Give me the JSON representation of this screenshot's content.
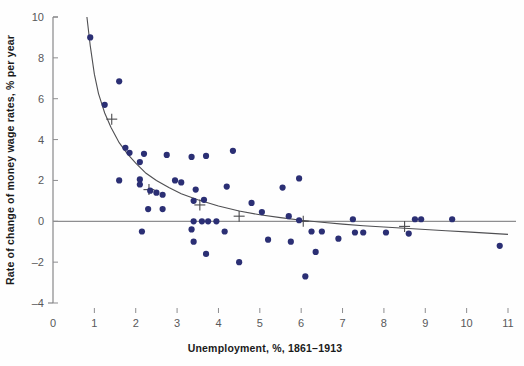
{
  "chart_data": {
    "type": "scatter",
    "title": "",
    "xlabel": "Unemployment, %, 1861–1913",
    "ylabel": "Rate of change of money wage rates, % per year",
    "xlim": [
      0,
      11
    ],
    "ylim": [
      -4,
      10
    ],
    "xticks": [
      0,
      1,
      2,
      3,
      4,
      5,
      6,
      7,
      8,
      9,
      10,
      11
    ],
    "yticks": [
      -4,
      -2,
      0,
      2,
      4,
      6,
      8,
      10
    ],
    "xtick_labels": [
      "0",
      "1",
      "2",
      "3",
      "4",
      "5",
      "6",
      "7",
      "8",
      "9",
      "10",
      "11"
    ],
    "ytick_labels": [
      "-4",
      "-2",
      "0",
      "2",
      "4",
      "6",
      "8",
      "10"
    ],
    "grid": false,
    "legend": false,
    "zero_line": true,
    "series": [
      {
        "name": "Observations",
        "marker": "circle",
        "color": "#2b2f74",
        "points": [
          [
            0.9,
            9.0
          ],
          [
            1.6,
            6.85
          ],
          [
            1.25,
            5.7
          ],
          [
            1.75,
            3.6
          ],
          [
            1.85,
            3.35
          ],
          [
            2.2,
            3.3
          ],
          [
            2.1,
            2.9
          ],
          [
            2.75,
            3.25
          ],
          [
            3.35,
            3.15
          ],
          [
            3.7,
            3.2
          ],
          [
            4.35,
            3.45
          ],
          [
            1.6,
            2.0
          ],
          [
            2.1,
            2.05
          ],
          [
            2.1,
            1.8
          ],
          [
            2.95,
            2.0
          ],
          [
            3.1,
            1.9
          ],
          [
            3.45,
            1.55
          ],
          [
            4.2,
            1.7
          ],
          [
            2.35,
            1.5
          ],
          [
            2.5,
            1.4
          ],
          [
            2.65,
            1.3
          ],
          [
            2.3,
            0.6
          ],
          [
            2.65,
            0.6
          ],
          [
            3.4,
            1.0
          ],
          [
            3.65,
            1.05
          ],
          [
            5.05,
            0.45
          ],
          [
            4.8,
            0.9
          ],
          [
            5.7,
            0.25
          ],
          [
            3.4,
            0.0
          ],
          [
            3.6,
            0.0
          ],
          [
            3.75,
            0.0
          ],
          [
            3.95,
            0.0
          ],
          [
            5.95,
            0.05
          ],
          [
            7.25,
            0.1
          ],
          [
            8.75,
            0.1
          ],
          [
            8.9,
            0.1
          ],
          [
            9.65,
            0.1
          ],
          [
            2.15,
            -0.5
          ],
          [
            3.35,
            -0.4
          ],
          [
            4.15,
            -0.5
          ],
          [
            5.2,
            -0.9
          ],
          [
            6.25,
            -0.5
          ],
          [
            6.5,
            -0.5
          ],
          [
            7.3,
            -0.55
          ],
          [
            7.5,
            -0.55
          ],
          [
            8.05,
            -0.55
          ],
          [
            8.6,
            -0.6
          ],
          [
            3.4,
            -1.0
          ],
          [
            5.75,
            -1.0
          ],
          [
            6.9,
            -0.85
          ],
          [
            10.8,
            -1.2
          ],
          [
            6.35,
            -1.5
          ],
          [
            3.7,
            -1.6
          ],
          [
            4.5,
            -2.0
          ],
          [
            6.1,
            -2.7
          ],
          [
            5.55,
            1.65
          ],
          [
            5.95,
            2.1
          ]
        ]
      },
      {
        "name": "Fitted mean points",
        "marker": "plus",
        "color": "#4a4a4d",
        "points": [
          [
            1.42,
            5.0
          ],
          [
            2.32,
            1.55
          ],
          [
            3.55,
            0.8
          ],
          [
            4.5,
            0.25
          ],
          [
            6.05,
            0.0
          ],
          [
            8.5,
            -0.25
          ]
        ]
      },
      {
        "name": "Phillips curve",
        "marker": "line",
        "color": "#4f4f52",
        "points": [
          [
            0.82,
            10.0
          ],
          [
            0.9,
            8.6
          ],
          [
            1.0,
            7.2
          ],
          [
            1.1,
            6.25
          ],
          [
            1.25,
            5.3
          ],
          [
            1.4,
            4.6
          ],
          [
            1.6,
            3.85
          ],
          [
            1.8,
            3.3
          ],
          [
            2.0,
            2.85
          ],
          [
            2.25,
            2.35
          ],
          [
            2.5,
            2.0
          ],
          [
            2.8,
            1.65
          ],
          [
            3.1,
            1.35
          ],
          [
            3.5,
            1.05
          ],
          [
            4.0,
            0.75
          ],
          [
            4.5,
            0.5
          ],
          [
            5.0,
            0.32
          ],
          [
            5.5,
            0.18
          ],
          [
            6.0,
            0.05
          ],
          [
            6.5,
            -0.05
          ],
          [
            7.0,
            -0.14
          ],
          [
            7.5,
            -0.22
          ],
          [
            8.0,
            -0.28
          ],
          [
            8.5,
            -0.34
          ],
          [
            9.0,
            -0.4
          ],
          [
            9.5,
            -0.46
          ],
          [
            10.0,
            -0.52
          ],
          [
            10.5,
            -0.58
          ],
          [
            11.0,
            -0.64
          ]
        ]
      }
    ]
  }
}
